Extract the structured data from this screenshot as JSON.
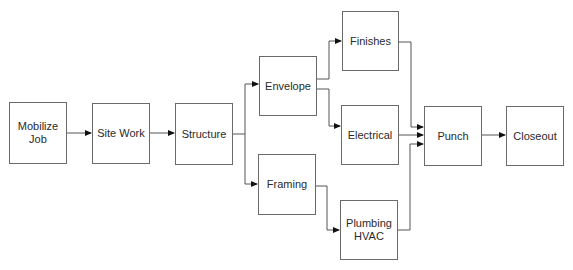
{
  "diagram": {
    "type": "flowchart",
    "nodes": [
      {
        "id": "mobilize",
        "label": "Mobilize\nJob"
      },
      {
        "id": "sitework",
        "label": "Site Work"
      },
      {
        "id": "structure",
        "label": "Structure"
      },
      {
        "id": "envelope",
        "label": "Envelope"
      },
      {
        "id": "framing",
        "label": "Framing"
      },
      {
        "id": "finishes",
        "label": "Finishes"
      },
      {
        "id": "electrical",
        "label": "Electrical"
      },
      {
        "id": "plumbing",
        "label": "Plumbing\nHVAC"
      },
      {
        "id": "punch",
        "label": "Punch"
      },
      {
        "id": "closeout",
        "label": "Closeout"
      }
    ],
    "edges": [
      {
        "from": "mobilize",
        "to": "sitework"
      },
      {
        "from": "sitework",
        "to": "structure"
      },
      {
        "from": "structure",
        "to": "envelope"
      },
      {
        "from": "structure",
        "to": "framing"
      },
      {
        "from": "envelope",
        "to": "finishes"
      },
      {
        "from": "envelope",
        "to": "electrical"
      },
      {
        "from": "framing",
        "to": "plumbing"
      },
      {
        "from": "finishes",
        "to": "punch"
      },
      {
        "from": "electrical",
        "to": "punch"
      },
      {
        "from": "plumbing",
        "to": "punch"
      },
      {
        "from": "punch",
        "to": "closeout"
      }
    ],
    "colors": {
      "stroke": "#6a6a6a",
      "text": "#2a2a2a",
      "background": "#ffffff"
    }
  }
}
